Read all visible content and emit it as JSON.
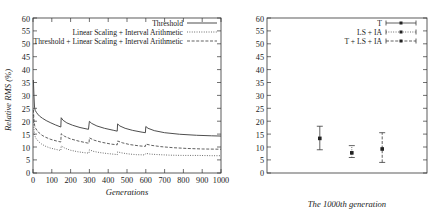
{
  "chart_data": [
    {
      "type": "line",
      "panel": "left",
      "title": "",
      "xlabel": "Generations",
      "ylabel": "Relative RMS (%)",
      "xlim": [
        0,
        1000
      ],
      "ylim": [
        0,
        60
      ],
      "xticks": [
        0,
        100,
        200,
        300,
        400,
        500,
        600,
        700,
        800,
        900,
        1000
      ],
      "yticks": [
        0,
        5,
        10,
        15,
        20,
        25,
        30,
        35,
        40,
        45,
        50,
        55,
        60
      ],
      "grid": false,
      "legend_position": "top-right",
      "legend": [
        {
          "label": "Threshold",
          "style": "solid"
        },
        {
          "label": "Linear Scaling + Interval Arithmetic",
          "style": "dotted"
        },
        {
          "label": "Threshold + Linear Scaling + Interval Arithmetic",
          "style": "dashed"
        }
      ],
      "series": [
        {
          "name": "Threshold",
          "style": "solid",
          "x": [
            2,
            5,
            8,
            12,
            18,
            25,
            35,
            50,
            70,
            95,
            120,
            148,
            150,
            160,
            180,
            210,
            250,
            295,
            300,
            312,
            340,
            380,
            430,
            448,
            450,
            462,
            490,
            530,
            580,
            598,
            600,
            612,
            645,
            700,
            780,
            870,
            950,
            1000
          ],
          "y": [
            36,
            30,
            25.5,
            24.2,
            23.5,
            22.8,
            22.0,
            21.2,
            20.3,
            19.4,
            18.6,
            17.8,
            21.4,
            20.4,
            19.4,
            18.5,
            17.6,
            16.9,
            20.0,
            19.2,
            18.2,
            17.3,
            16.5,
            16.2,
            19.0,
            18.2,
            17.3,
            16.5,
            15.8,
            15.6,
            18.0,
            17.3,
            16.4,
            15.6,
            15.0,
            14.6,
            14.4,
            14.3
          ]
        },
        {
          "name": "Linear Scaling + Interval Arithmetic",
          "style": "dotted",
          "x": [
            2,
            5,
            9,
            14,
            22,
            32,
            46,
            65,
            90,
            118,
            148,
            150,
            170,
            200,
            240,
            280,
            298,
            300,
            320,
            355,
            400,
            440,
            448,
            450,
            470,
            505,
            550,
            595,
            600,
            625,
            670,
            730,
            800,
            880,
            950,
            1000
          ],
          "y": [
            22.5,
            17.0,
            14.6,
            13.6,
            12.8,
            12.0,
            11.2,
            10.4,
            9.7,
            9.2,
            8.7,
            10.5,
            9.6,
            8.8,
            8.2,
            7.8,
            7.7,
            9.0,
            8.4,
            7.9,
            7.5,
            7.2,
            7.1,
            8.2,
            7.8,
            7.4,
            7.1,
            7.0,
            7.6,
            7.3,
            7.1,
            6.9,
            6.8,
            6.8,
            6.7,
            6.7
          ]
        },
        {
          "name": "Threshold + Linear Scaling + Interval Arithmetic",
          "style": "dashed",
          "x": [
            2,
            5,
            9,
            14,
            22,
            33,
            48,
            68,
            95,
            125,
            148,
            150,
            168,
            200,
            245,
            290,
            298,
            300,
            325,
            365,
            415,
            448,
            450,
            475,
            515,
            565,
            598,
            600,
            630,
            680,
            745,
            820,
            900,
            1000
          ],
          "y": [
            24.5,
            20.5,
            18.3,
            17.3,
            16.4,
            15.5,
            14.6,
            13.8,
            13.0,
            12.4,
            12.0,
            15.2,
            14.2,
            13.2,
            12.3,
            11.6,
            11.5,
            13.6,
            12.7,
            11.9,
            11.2,
            10.9,
            12.4,
            11.7,
            11.0,
            10.5,
            10.3,
            11.2,
            10.7,
            10.2,
            9.8,
            9.5,
            9.3,
            9.2
          ]
        }
      ]
    },
    {
      "type": "scatter",
      "panel": "right",
      "title": "",
      "xlabel": "The 1000th generation",
      "ylabel": "",
      "ylim": [
        0,
        60
      ],
      "yticks": [
        0,
        5,
        10,
        15,
        20,
        25,
        30,
        35,
        40,
        45,
        50,
        55,
        60
      ],
      "grid": false,
      "legend_position": "top-right",
      "legend": [
        {
          "label": "T",
          "style": "errorbar-solid"
        },
        {
          "label": "LS + IA",
          "style": "errorbar-dotted"
        },
        {
          "label": "T + LS + IA",
          "style": "errorbar-dashed"
        }
      ],
      "points": [
        {
          "name": "T",
          "x": 1,
          "y": 13.4,
          "ymin": 9.0,
          "ymax": 18.1
        },
        {
          "name": "LS + IA",
          "x": 2,
          "y": 7.8,
          "ymin": 6.0,
          "ymax": 10.6
        },
        {
          "name": "T + LS + IA",
          "x": 3,
          "y": 9.3,
          "ymin": 4.1,
          "ymax": 15.6
        }
      ]
    }
  ],
  "left_panel": {
    "ylabel": "Relative RMS (%)",
    "xlabel": "Generations",
    "yticks": [
      "60",
      "55",
      "50",
      "45",
      "40",
      "35",
      "30",
      "25",
      "20",
      "15",
      "10",
      "5",
      "0"
    ],
    "xticks": [
      "0",
      "100",
      "200",
      "300",
      "400",
      "500",
      "600",
      "700",
      "800",
      "900",
      "1000"
    ],
    "legend": {
      "item0": "Threshold",
      "item1": "Linear Scaling + Interval Arithmetic",
      "item2": "Threshold + Linear Scaling + Interval Arithmetic"
    }
  },
  "right_panel": {
    "xlabel": "The 1000th generation",
    "yticks": [
      "60",
      "55",
      "50",
      "45",
      "40",
      "35",
      "30",
      "25",
      "20",
      "15",
      "10",
      "5",
      "0"
    ],
    "legend": {
      "item0": "T",
      "item1": "LS + IA",
      "item2": "T + LS + IA"
    }
  },
  "colors": {
    "axis": "#333333",
    "curve": "#444444",
    "marker": "#222222",
    "background": "#ffffff"
  }
}
